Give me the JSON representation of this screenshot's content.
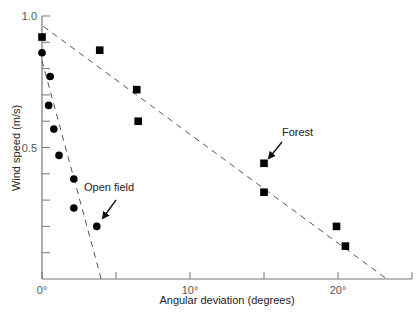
{
  "chart_data": {
    "type": "scatter",
    "title": "",
    "xlabel": "Angular deviation (degrees)",
    "ylabel": "Wind speed (m/s)",
    "xlim": [
      0,
      25
    ],
    "ylim": [
      0,
      1.0
    ],
    "x_major_ticks": [
      0,
      5,
      10,
      15,
      20,
      25
    ],
    "x_tick_labels": [
      {
        "value": 0,
        "label": "0°"
      },
      {
        "value": 10,
        "label": "10°"
      },
      {
        "value": 20,
        "label": "20°"
      }
    ],
    "y_ticks": [
      0.1,
      0.2,
      0.3,
      0.4,
      0.5,
      0.6,
      0.7,
      0.8,
      0.9,
      1.0
    ],
    "y_tick_labels": [
      {
        "value": 0.5,
        "label": "0.5"
      },
      {
        "value": 1.0,
        "label": "1.0"
      }
    ],
    "grid": false,
    "legend": "none",
    "series": [
      {
        "name": "Open field",
        "marker": "circle",
        "points": [
          {
            "x": 0.0,
            "y": 0.86
          },
          {
            "x": 0.55,
            "y": 0.77
          },
          {
            "x": 0.45,
            "y": 0.66
          },
          {
            "x": 0.8,
            "y": 0.57
          },
          {
            "x": 1.15,
            "y": 0.47
          },
          {
            "x": 2.15,
            "y": 0.38
          },
          {
            "x": 2.15,
            "y": 0.27
          },
          {
            "x": 3.7,
            "y": 0.2
          }
        ],
        "fit_line": {
          "x": [
            0.0,
            4.0
          ],
          "y": [
            0.83,
            0.0
          ],
          "style": "dashed"
        }
      },
      {
        "name": "Forest",
        "marker": "square",
        "points": [
          {
            "x": 0.0,
            "y": 0.92
          },
          {
            "x": 3.9,
            "y": 0.87
          },
          {
            "x": 6.4,
            "y": 0.72
          },
          {
            "x": 6.5,
            "y": 0.6
          },
          {
            "x": 15.0,
            "y": 0.44
          },
          {
            "x": 15.0,
            "y": 0.33
          },
          {
            "x": 19.9,
            "y": 0.2
          },
          {
            "x": 20.5,
            "y": 0.125
          }
        ],
        "fit_line": {
          "x": [
            0.1,
            23.3
          ],
          "y": [
            0.96,
            0.0
          ],
          "style": "dashed"
        }
      }
    ],
    "annotations": [
      {
        "text": "Forest",
        "points_to": {
          "x": 15.0,
          "y": 0.44
        },
        "arrow": true
      },
      {
        "text": "Open field",
        "points_to": {
          "x": 3.7,
          "y": 0.2
        },
        "arrow": true
      }
    ]
  }
}
